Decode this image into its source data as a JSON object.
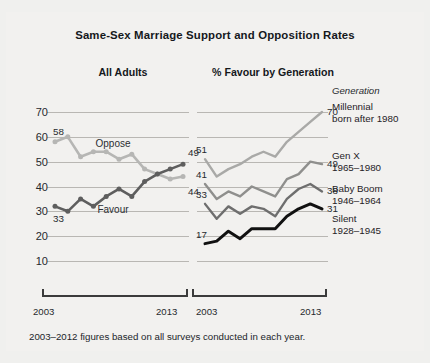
{
  "figure": {
    "title": "Same-Sex Marriage Support and Opposition Rates",
    "footnote": "2003–2012 figures based on all surveys conducted in each year.",
    "background": "#f2f1ef"
  },
  "colors": {
    "oppose": "#b6b6b4",
    "favour": "#5e5e5e",
    "millennial": "#a9a9a7",
    "genx": "#8f8f8d",
    "babyboom": "#6e6e6e",
    "silent": "#111111",
    "gridline": "#b9b7b3",
    "axis": "#3b3b3b",
    "text": "#1a1a1a"
  },
  "chart_data": [
    {
      "type": "line",
      "panel": "left",
      "title": "All Adults",
      "xlabel": "",
      "ylabel": "",
      "xlim": [
        2003,
        2013
      ],
      "ylim": [
        5,
        73
      ],
      "yticks": [
        70,
        60,
        50,
        40,
        30,
        20,
        10
      ],
      "xticks": [
        2003,
        2013
      ],
      "xticklabels": [
        "2003",
        "2013"
      ],
      "grid": true,
      "legend_position": "inline",
      "markers": true,
      "x": [
        2003,
        2004,
        2005,
        2006,
        2007,
        2008,
        2009,
        2010,
        2011,
        2012,
        2013
      ],
      "series": [
        {
          "name": "Oppose",
          "color_key": "oppose",
          "inline_label": "Oppose",
          "start_label": "58",
          "end_label": "44",
          "values": [
            58,
            60,
            52,
            54,
            54,
            51,
            53,
            47,
            45,
            43,
            44
          ]
        },
        {
          "name": "Favour",
          "color_key": "favour",
          "inline_label": "Favour",
          "start_label": "33",
          "end_label": "49",
          "values": [
            32,
            30,
            35,
            32,
            36,
            39,
            36,
            42,
            45,
            47,
            49
          ]
        }
      ]
    },
    {
      "type": "line",
      "panel": "right",
      "title": "% Favour by Generation",
      "xlabel": "",
      "ylabel": "",
      "xlim": [
        2003,
        2013
      ],
      "ylim": [
        5,
        73
      ],
      "yticks": [
        70,
        60,
        50,
        40,
        30,
        20,
        10
      ],
      "xticks": [
        2003,
        2013
      ],
      "xticklabels": [
        "2003",
        "2013"
      ],
      "grid": true,
      "legend_position": "right",
      "markers": false,
      "legend_header": "Generation",
      "x": [
        2003,
        2004,
        2005,
        2006,
        2007,
        2008,
        2009,
        2010,
        2011,
        2012,
        2013
      ],
      "series": [
        {
          "name": "Millennial",
          "subtitle": "born after 1980",
          "color_key": "millennial",
          "start_label": "51",
          "end_label": "70",
          "values": [
            51,
            44,
            47,
            49,
            52,
            54,
            52,
            58,
            62,
            66,
            70
          ]
        },
        {
          "name": "Gen X",
          "subtitle": "1965–1980",
          "color_key": "genx",
          "start_label": "41",
          "end_label": "49",
          "values": [
            41,
            35,
            38,
            36,
            40,
            38,
            36,
            43,
            45,
            50,
            49
          ]
        },
        {
          "name": "Baby Boom",
          "subtitle": "1946–1964",
          "color_key": "babyboom",
          "start_label": "33",
          "end_label": "38",
          "values": [
            33,
            27,
            32,
            29,
            32,
            31,
            28,
            35,
            39,
            41,
            38
          ]
        },
        {
          "name": "Silent",
          "subtitle": "1928–1945",
          "color_key": "silent",
          "start_label": "17",
          "end_label": "31",
          "values": [
            17,
            18,
            22,
            19,
            23,
            23,
            23,
            28,
            31,
            33,
            31
          ]
        }
      ]
    }
  ]
}
